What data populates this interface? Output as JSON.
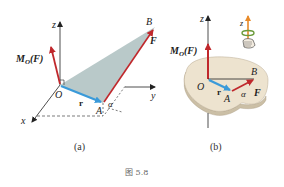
{
  "diagram_a": {
    "caption": "(a)",
    "labels": {
      "z": "z",
      "y": "y",
      "x": "x",
      "O": "O",
      "A": "A",
      "B": "B",
      "F": "F",
      "r": "r",
      "alpha": "α",
      "moment_main": "M",
      "moment_sub": "O",
      "moment_arg": "(F)"
    }
  },
  "diagram_b": {
    "caption": "(b)",
    "labels": {
      "z": "z",
      "z_inset": "z",
      "O": "O",
      "A": "A",
      "B": "B",
      "F": "F",
      "r": "r",
      "alpha": "α",
      "moment_main": "M",
      "moment_sub": "O",
      "moment_arg": "(F)"
    }
  },
  "figure_caption": "图 5.8",
  "colors": {
    "force_red": "#c0282c",
    "r_blue": "#3a9ad9",
    "triangle_fill": "#b9c9c9",
    "plate_fill": "#ede3cf",
    "plate_edge": "#cbbfa6",
    "axis_orange": "#e88a2a",
    "inset_green": "#6a9a3a"
  }
}
